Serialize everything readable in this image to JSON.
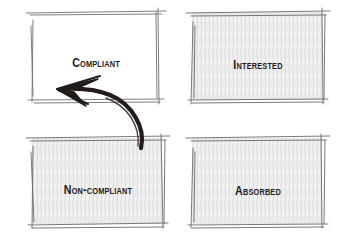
{
  "diagram": {
    "type": "2x2-matrix-sketch",
    "quadrants": [
      {
        "id": "compliant",
        "label": "Compliant",
        "position": "top-left",
        "shaded": false
      },
      {
        "id": "interested",
        "label": "Interested",
        "position": "top-right",
        "shaded": true
      },
      {
        "id": "noncompliant",
        "label": "Non-compliant",
        "position": "bottom-left",
        "shaded": true
      },
      {
        "id": "absorbed",
        "label": "Absorbed",
        "position": "bottom-right",
        "shaded": true
      }
    ],
    "arrows": [
      {
        "from": "noncompliant",
        "to": "compliant",
        "style": "curved-brush"
      }
    ],
    "colors": {
      "ink": "#1e1b19",
      "pencil": "#6b6b6b",
      "hatch": "#c9c9c9",
      "background": "#ffffff"
    }
  }
}
